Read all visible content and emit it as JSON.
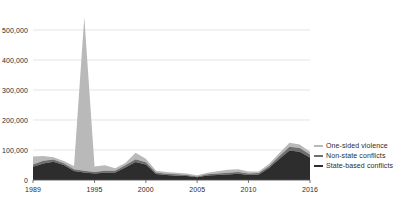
{
  "chart_data": {
    "type": "area",
    "title": "",
    "subtitle": "",
    "xlabel": "",
    "ylabel": "",
    "stacked": true,
    "grid": true,
    "legend_position": "right",
    "xlim": [
      1989,
      2016
    ],
    "ylim": [
      0,
      560000
    ],
    "x_tick_labels": [
      "1989",
      "1995",
      "2000",
      "2005",
      "2010",
      "2016"
    ],
    "x_tick_values": [
      1989,
      1995,
      2000,
      2005,
      2010,
      2016
    ],
    "y_tick_labels": [
      "0",
      "100,000",
      "200,000",
      "300,000",
      "400,000",
      "500,000"
    ],
    "y_tick_values": [
      0,
      100000,
      200000,
      300000,
      400000,
      500000
    ],
    "x": [
      1989,
      1990,
      1991,
      1992,
      1993,
      1994,
      1995,
      1996,
      1997,
      1998,
      1999,
      2000,
      2001,
      2002,
      2003,
      2004,
      2005,
      2006,
      2007,
      2008,
      2009,
      2010,
      2011,
      2012,
      2013,
      2014,
      2015,
      2016
    ],
    "series": [
      {
        "name": "State-based conflicts",
        "color": "#2d2d2d",
        "values": [
          44000,
          55000,
          61000,
          50000,
          30000,
          25000,
          22000,
          24000,
          25000,
          42000,
          60000,
          52000,
          20000,
          17000,
          14000,
          13000,
          9000,
          15000,
          17000,
          18000,
          21000,
          17000,
          18000,
          40000,
          70000,
          98000,
          94000,
          75000
        ]
      },
      {
        "name": "Non-state conflicts",
        "color": "#6e6e6e",
        "values": [
          8000,
          9000,
          7000,
          6000,
          6000,
          6000,
          5000,
          7000,
          6000,
          7000,
          9000,
          7000,
          5000,
          4000,
          5000,
          4000,
          3000,
          4000,
          5000,
          6000,
          6000,
          5000,
          5000,
          6000,
          9000,
          13000,
          13000,
          10000
        ]
      },
      {
        "name": "One-sided violence",
        "color": "#b9b9b9",
        "values": [
          26000,
          16000,
          8000,
          7000,
          11000,
          512000,
          18000,
          18000,
          8000,
          8000,
          22000,
          12000,
          6000,
          6000,
          5000,
          5000,
          4000,
          5000,
          7000,
          10000,
          9000,
          6000,
          5000,
          7000,
          10000,
          13000,
          11000,
          9000
        ]
      }
    ],
    "annotations": []
  },
  "legend": {
    "items": [
      {
        "label": "One-sided violence",
        "color": "#b9b9b9"
      },
      {
        "label": "Non-state conflicts",
        "color": "#6e6e6e"
      },
      {
        "label": "State-based conflicts",
        "color": "#2d2d2d"
      }
    ]
  },
  "axes": {
    "grid_color": "#d8d8d8",
    "axis_color": "#555555",
    "tick_color": "#2b2b2b"
  }
}
